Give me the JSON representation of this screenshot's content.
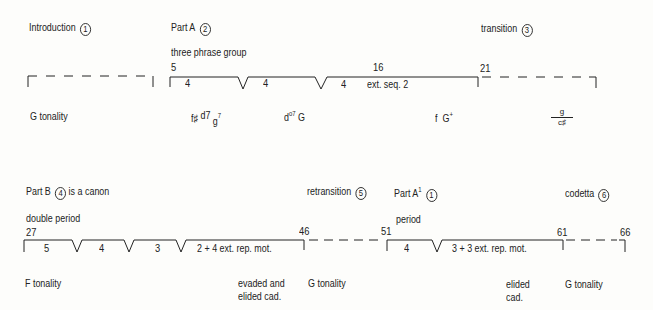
{
  "system1": {
    "sections": [
      {
        "label": "Introduction",
        "number": "1"
      },
      {
        "label": "Part A",
        "number": "2"
      },
      {
        "label": "transition",
        "number": "3"
      }
    ],
    "subtitle": "three phrase group",
    "measures": [
      "5",
      "16",
      "21"
    ],
    "phrases": [
      "4",
      "4",
      "4",
      "ext. seq. 2"
    ],
    "tonality": "G tonality",
    "harmony": {
      "h1": "f♯",
      "h2": "d7",
      "h3": "g",
      "h3_sup": "7",
      "h4": "d",
      "h4_sup": "o7",
      "h5": "G",
      "h6": "f",
      "h7": "G",
      "h7_sup": "+",
      "frac_top": "g",
      "frac_bottom": "c♯"
    }
  },
  "system2": {
    "sections": [
      {
        "label": "Part B",
        "number": "4",
        "suffix": "is a canon"
      },
      {
        "label": "retransition",
        "number": "5"
      },
      {
        "label": "Part A",
        "sup": "1",
        "number": "1"
      },
      {
        "label": "codetta",
        "number": "6"
      }
    ],
    "subtitle_left": "double period",
    "subtitle_right": "period",
    "measures": [
      "27",
      "46",
      "51",
      "61",
      "66"
    ],
    "phrases": [
      "5",
      "4",
      "3",
      "2 + 4 ext. rep. mot.",
      "4",
      "3 + 3 ext. rep. mot."
    ],
    "tonality_f": "F tonality",
    "cadence1_line1": "evaded and",
    "cadence1_line2": "elided cad.",
    "tonality_g1": "G tonality",
    "cadence2_line1": "elided",
    "cadence2_line2": "cad.",
    "tonality_g2": "G tonality"
  }
}
